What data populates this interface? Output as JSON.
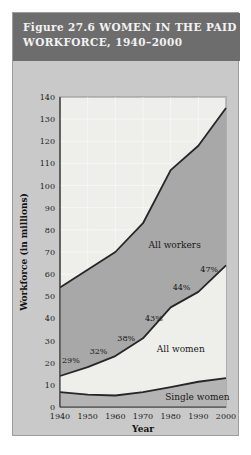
{
  "figure": {
    "title_line1": "Figure 27.6  WOMEN IN THE PAID",
    "title_line2": "WORKFORCE, 1940–2000",
    "band_color": "#6d6d6d",
    "frame_color": "#c9c9c9"
  },
  "chart_data": {
    "type": "area",
    "title": "Figure 27.6  WOMEN IN THE PAID WORKFORCE, 1940–2000",
    "xlabel": "Year",
    "ylabel": "Workforce (in millions)",
    "x": [
      1940,
      1950,
      1960,
      1970,
      1980,
      1990,
      2000
    ],
    "xticklabels": [
      "1940",
      "1950",
      "1960",
      "1970",
      "1980",
      "1990",
      "2000"
    ],
    "xlim": [
      1940,
      2000
    ],
    "ylim": [
      0,
      140
    ],
    "yticks": [
      0,
      10,
      20,
      30,
      40,
      50,
      60,
      70,
      80,
      90,
      100,
      110,
      120,
      130,
      140
    ],
    "yticklabels": [
      "0",
      "10",
      "20",
      "30",
      "40",
      "50",
      "60",
      "70",
      "80",
      "90",
      "100",
      "110",
      "120",
      "130",
      "140"
    ],
    "grid": true,
    "legend": "inline-labels",
    "series": [
      {
        "name": "All workers",
        "label": "All workers",
        "color": "#a8a8a8",
        "values": [
          54,
          62,
          70,
          83,
          107,
          118,
          135
        ]
      },
      {
        "name": "All women",
        "label": "All women",
        "color": "#eeeeea",
        "values": [
          14,
          18,
          23,
          31,
          45,
          52,
          64
        ]
      },
      {
        "name": "Single women",
        "label": "Single women",
        "color": "#b4b4b4",
        "values": [
          6.7,
          5.6,
          5.2,
          6.7,
          9.0,
          11.4,
          13.0
        ]
      }
    ],
    "annotations": [
      {
        "text": "29%",
        "x": 1940,
        "y": 20
      },
      {
        "text": "32%",
        "x": 1950,
        "y": 24
      },
      {
        "text": "38%",
        "x": 1960,
        "y": 30
      },
      {
        "text": "43%",
        "x": 1970,
        "y": 39
      },
      {
        "text": "44%",
        "x": 1980,
        "y": 53
      },
      {
        "text": "47%",
        "x": 1990,
        "y": 61
      }
    ]
  }
}
